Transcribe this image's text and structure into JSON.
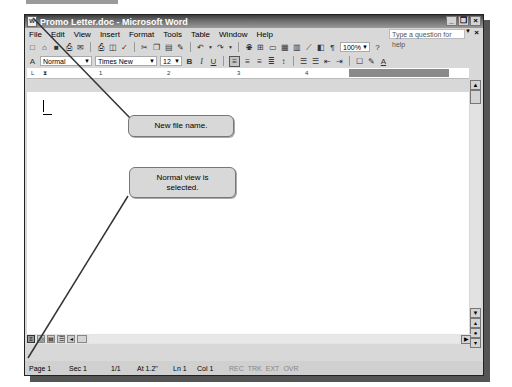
{
  "window": {
    "title": "Promo Letter.doc - Microsoft Word",
    "controls": [
      "minimize",
      "restore",
      "close"
    ]
  },
  "menubar": {
    "items": [
      "File",
      "Edit",
      "View",
      "Insert",
      "Format",
      "Tools",
      "Table",
      "Window",
      "Help"
    ],
    "help_placeholder": "Type a question for help"
  },
  "standard_toolbar": {
    "zoom": "100%"
  },
  "formatting_toolbar": {
    "style": "Normal",
    "font": "Times New Roman",
    "size": "12",
    "bold": "B",
    "italic": "I",
    "underline": "U"
  },
  "ruler": {
    "marks": [
      "1",
      "2",
      "3",
      "4",
      "5"
    ]
  },
  "status_bar": {
    "page": "Page 1",
    "section": "Sec 1",
    "page_of": "1/1",
    "at": "At 1.2\"",
    "line": "Ln 1",
    "col": "Col 1",
    "modes": [
      "REC",
      "TRK",
      "EXT",
      "OVR"
    ]
  },
  "callouts": [
    {
      "text": "New file name."
    },
    {
      "text": "Normal view is selected."
    }
  ],
  "colors": {
    "titlebar": "#4a4a4a",
    "callout_bg": "#d8d8d8",
    "chrome": "#d8d8d8"
  }
}
